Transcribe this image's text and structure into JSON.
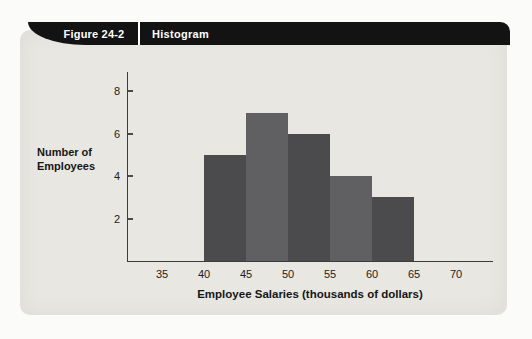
{
  "header": {
    "figure_label": "Figure 24-2",
    "title": "Histogram"
  },
  "chart": {
    "ylabel_line1": "Number of",
    "ylabel_line2": "Employees",
    "xlabel": "Employee Salaries (thousands of dollars)"
  },
  "chart_data": {
    "type": "bar",
    "subtype": "histogram",
    "title": "Histogram",
    "xlabel": "Employee Salaries (thousands of dollars)",
    "ylabel": "Number of Employees",
    "bin_edges": [
      40,
      45,
      50,
      55,
      60,
      65
    ],
    "categories": [
      "40-45",
      "45-50",
      "50-55",
      "55-60",
      "60-65"
    ],
    "values": [
      5,
      7,
      6,
      4,
      3
    ],
    "x_ticks": [
      35,
      40,
      45,
      50,
      55,
      60,
      65,
      70
    ],
    "y_ticks": [
      2,
      4,
      6,
      8
    ],
    "xlim": [
      30,
      75
    ],
    "ylim": [
      0,
      9
    ],
    "grid": false,
    "legend": false,
    "bar_colors_alternating": [
      "#4b4b4d",
      "#606062"
    ]
  },
  "colors": {
    "panel_background": "#e9e7e2",
    "banner_background": "#131313",
    "banner_text": "#ffffff",
    "axis": "#3c3c3c",
    "text": "#161616"
  }
}
